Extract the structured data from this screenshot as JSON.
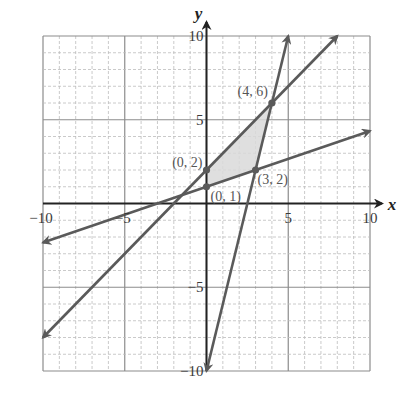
{
  "chart_data": {
    "type": "line",
    "title": "",
    "xlabel": "x",
    "ylabel": "y",
    "xlim": [
      -10,
      10
    ],
    "ylim": [
      -10,
      10
    ],
    "grid": {
      "minor_step": 1,
      "major_step": 5,
      "minor_style": "dashed",
      "major_style": "solid"
    },
    "x_ticks": [
      {
        "value": -10,
        "label": "−10"
      },
      {
        "value": -5,
        "label": "−5"
      },
      {
        "value": 5,
        "label": "5"
      },
      {
        "value": 10,
        "label": "10"
      }
    ],
    "y_ticks": [
      {
        "value": 10,
        "label": "10"
      },
      {
        "value": 5,
        "label": "5"
      },
      {
        "value": -5,
        "label": "−5"
      },
      {
        "value": -10,
        "label": "−10"
      }
    ],
    "series": [
      {
        "name": "y = x/3 + 1",
        "from": [
          -10,
          -2.33
        ],
        "to": [
          10,
          4.33
        ],
        "arrows": "both"
      },
      {
        "name": "y = x + 2",
        "from": [
          -10,
          -8
        ],
        "to": [
          8,
          10
        ],
        "arrows": "both"
      },
      {
        "name": "y = 4x - 10",
        "from": [
          0,
          -10
        ],
        "to": [
          5,
          10
        ],
        "arrows": "both"
      }
    ],
    "shaded_region": {
      "vertices": [
        [
          0,
          1
        ],
        [
          3,
          2
        ],
        [
          4,
          6
        ],
        [
          0,
          2
        ]
      ],
      "color": "#d9d9d9"
    },
    "points": [
      {
        "x": 0,
        "y": 2,
        "label": "(0, 2)"
      },
      {
        "x": 0,
        "y": 1,
        "label": "(0, 1)"
      },
      {
        "x": 3,
        "y": 2,
        "label": "(3, 2)"
      },
      {
        "x": 4,
        "y": 6,
        "label": "(4, 6)"
      }
    ],
    "colors": {
      "line": "#5a5a5a",
      "axis": "#222222",
      "grid_minor": "#bdbdbd",
      "grid_major": "#8c8c8c"
    }
  }
}
